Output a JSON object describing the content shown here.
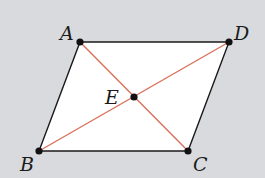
{
  "diagram": {
    "type": "parallelogram-with-diagonals",
    "colors": {
      "background": "#d9dade",
      "fill": "#ffffff",
      "edge": "#1a1a1a",
      "diagonal": "#d9705a",
      "point": "#111111"
    },
    "points": {
      "A": {
        "label": "A",
        "x": 80,
        "y": 42,
        "label_x": 60,
        "label_y": 40
      },
      "D": {
        "label": "D",
        "x": 229,
        "y": 42,
        "label_x": 234,
        "label_y": 40
      },
      "B": {
        "label": "B",
        "x": 39,
        "y": 151,
        "label_x": 20,
        "label_y": 171
      },
      "C": {
        "label": "C",
        "x": 188,
        "y": 151,
        "label_x": 193,
        "label_y": 171
      },
      "E": {
        "label": "E",
        "x": 134,
        "y": 97,
        "label_x": 105,
        "label_y": 104
      }
    },
    "edges": [
      {
        "from": "A",
        "to": "D"
      },
      {
        "from": "D",
        "to": "C"
      },
      {
        "from": "C",
        "to": "B"
      },
      {
        "from": "B",
        "to": "A"
      }
    ],
    "diagonals": [
      {
        "from": "A",
        "to": "C"
      },
      {
        "from": "B",
        "to": "D"
      }
    ]
  }
}
